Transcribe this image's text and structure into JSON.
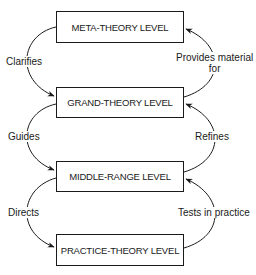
{
  "levels": [
    {
      "name": "META-THEORY LEVEL"
    },
    {
      "name": "GRAND-THEORY LEVEL"
    },
    {
      "name": "MIDDLE-RANGE LEVEL"
    },
    {
      "name": "PRACTICE-THEORY LEVEL"
    }
  ],
  "down_arrows": [
    {
      "label": "Clarifies"
    },
    {
      "label": "Guides"
    },
    {
      "label": "Directs"
    }
  ],
  "up_arrows": [
    {
      "label_line1": "Provides material",
      "label_line2": "for"
    },
    {
      "label": "Refines"
    },
    {
      "label": "Tests in practice"
    }
  ],
  "colors": {
    "stroke": "#1a1a1a",
    "background": "#ffffff"
  }
}
